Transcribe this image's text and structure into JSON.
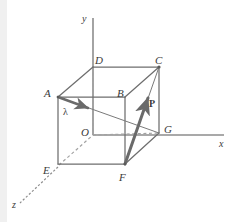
{
  "figure": {
    "background_color": "#ffffff",
    "line_color": "#6e6e6e",
    "dashed_color": "#9a9a9a",
    "vector_color": "#6a6a6a",
    "label_color": "#3a3a3a",
    "left_strip_color": "#f0f0f0"
  },
  "axes": [
    {
      "name": "y-axis",
      "label": "y",
      "label_x": 82,
      "label_y": 14
    },
    {
      "name": "x-axis",
      "label": "x",
      "label_x": 219,
      "label_y": 139
    },
    {
      "name": "z-axis",
      "label": "z",
      "label_x": 12,
      "label_y": 200
    }
  ],
  "origin": {
    "label": "O",
    "label_x": 81,
    "label_y": 127
  },
  "vertices": [
    {
      "name": "A",
      "label": "A",
      "label_x": 44,
      "label_y": 88
    },
    {
      "name": "B",
      "label": "B",
      "label_x": 117,
      "label_y": 88
    },
    {
      "name": "C",
      "label": "C",
      "label_x": 155,
      "label_y": 57
    },
    {
      "name": "D",
      "label": "D",
      "label_x": 95,
      "label_y": 57
    },
    {
      "name": "E",
      "label": "E",
      "label_x": 43,
      "label_y": 165
    },
    {
      "name": "F",
      "label": "F",
      "label_x": 119,
      "label_y": 175
    },
    {
      "name": "G",
      "label": "G",
      "label_x": 163,
      "label_y": 125
    }
  ],
  "vectors": [
    {
      "name": "lambda-vector",
      "label": "λ",
      "from": "A",
      "toward": "G",
      "label_x": 63,
      "label_y": 110
    },
    {
      "name": "p-vector",
      "label": "P",
      "from": "F",
      "toward": "C",
      "label_x": 149,
      "label_y": 103
    }
  ]
}
